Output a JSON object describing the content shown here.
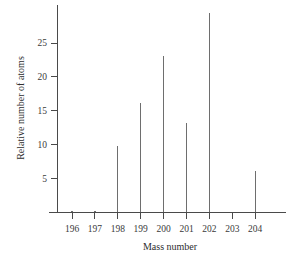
{
  "chart_data": {
    "type": "bar",
    "title": "",
    "subtitle": "",
    "xlabel": "Mass number",
    "ylabel": "Relative number of atoms",
    "categories": [
      196,
      197,
      198,
      199,
      200,
      201,
      202,
      203,
      204
    ],
    "values": [
      0.2,
      0.2,
      9.7,
      16.1,
      23.1,
      13.2,
      29.5,
      0.0,
      6.1
    ],
    "xtick_labels": [
      "196",
      "197",
      "198",
      "199",
      "200",
      "201",
      "202",
      "203",
      "204"
    ],
    "ytick_labels": [
      "5",
      "10",
      "15",
      "20",
      "25"
    ],
    "ytick_values": [
      5,
      10,
      15,
      20,
      25
    ],
    "xlim": [
      195.3,
      205.3
    ],
    "ylim": [
      0,
      30.5
    ],
    "grid": false,
    "legend": false,
    "legend_position": "none",
    "series_color": "#6e6e6e",
    "axis_color": "#4a4a4a",
    "background_color": "#ffffff"
  },
  "figure": {
    "axis_titles": {
      "x": "Mass number",
      "y": "Relative number of atoms"
    }
  }
}
